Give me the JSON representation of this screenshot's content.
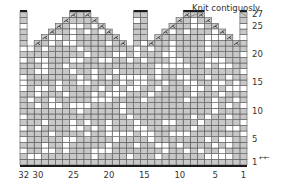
{
  "chart": {
    "columns": 32,
    "rows": 27,
    "colors": {
      "gray": "#c8c8c8",
      "white": "#ffffff",
      "grid": "#555555",
      "bar": "#1a1a1a",
      "text": "#333333"
    },
    "x_labels": [
      {
        "col": 32,
        "text": "32"
      },
      {
        "col": 30,
        "text": "30"
      },
      {
        "col": 25,
        "text": "25"
      },
      {
        "col": 20,
        "text": "20"
      },
      {
        "col": 15,
        "text": "15"
      },
      {
        "col": 10,
        "text": "10"
      },
      {
        "col": 5,
        "text": "5"
      },
      {
        "col": 1,
        "text": "1"
      }
    ],
    "y_labels": [
      {
        "row": 27,
        "text": "27"
      },
      {
        "row": 25,
        "text": "25"
      },
      {
        "row": 20,
        "text": "20"
      },
      {
        "row": 15,
        "text": "15"
      },
      {
        "row": 10,
        "text": "10"
      },
      {
        "row": 5,
        "text": "5"
      },
      {
        "row": 1,
        "text": "1"
      }
    ],
    "row1_arrows": "←←",
    "annotation": "Knit contiguosly",
    "shape": {
      "full_width_up_to_row": 21,
      "single_columns": [
        {
          "cols": [
            32
          ],
          "top_row": 27
        },
        {
          "cols": [
            16,
            15
          ],
          "top_row": 27
        },
        {
          "cols": [
            1
          ],
          "top_row": 27
        }
      ],
      "peaks": [
        {
          "top_cols": [
            25,
            24,
            23
          ],
          "top_row": 27,
          "base_row": 22
        },
        {
          "top_cols": [
            9,
            8,
            7
          ],
          "top_row": 27,
          "base_row": 22
        }
      ]
    }
  }
}
